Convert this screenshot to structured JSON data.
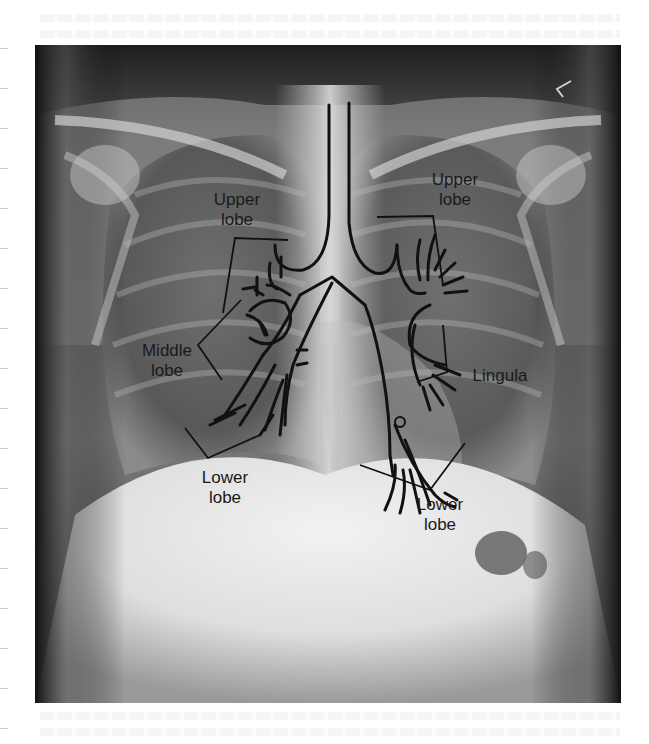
{
  "figure": {
    "type": "annotated chest x-ray (PA view) with bronchial tree overlay",
    "labels": {
      "right_upper": "Upper\nlobe",
      "right_middle": "Middle\nlobe",
      "right_lower": "Lower\nlobe",
      "left_upper": "Upper\nlobe",
      "left_lingula": "Lingula",
      "left_lower": "Lower\nlobe"
    },
    "colors": {
      "line": "#111111",
      "label_text": "#1a1a1a",
      "film_dark": "#222222",
      "page_bg": "#ffffff"
    }
  }
}
